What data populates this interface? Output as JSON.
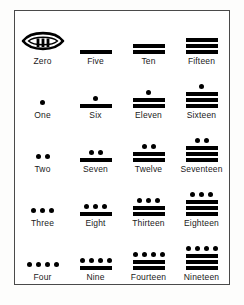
{
  "chart_data": {
    "type": "table",
    "columns": 4,
    "rows": 5,
    "notation": {
      "dot_value": 1,
      "bar_value": 5,
      "zero_symbol": "shell"
    },
    "cells": [
      {
        "value": 0,
        "label": "Zero",
        "symbol": "shell",
        "dots": 0,
        "bars": 0,
        "shell_strokes": 3
      },
      {
        "value": 5,
        "label": "Five",
        "symbol": "bars",
        "dots": 0,
        "bars": 1
      },
      {
        "value": 10,
        "label": "Ten",
        "symbol": "bars",
        "dots": 0,
        "bars": 2
      },
      {
        "value": 15,
        "label": "Fifteen",
        "symbol": "bars",
        "dots": 0,
        "bars": 3
      },
      {
        "value": 1,
        "label": "One",
        "symbol": "dots",
        "dots": 1,
        "bars": 0
      },
      {
        "value": 6,
        "label": "Six",
        "symbol": "mixed",
        "dots": 1,
        "bars": 1
      },
      {
        "value": 11,
        "label": "Eleven",
        "symbol": "mixed",
        "dots": 1,
        "bars": 2
      },
      {
        "value": 16,
        "label": "Sixteen",
        "symbol": "mixed",
        "dots": 1,
        "bars": 3
      },
      {
        "value": 2,
        "label": "Two",
        "symbol": "dots",
        "dots": 2,
        "bars": 0
      },
      {
        "value": 7,
        "label": "Seven",
        "symbol": "mixed",
        "dots": 2,
        "bars": 1
      },
      {
        "value": 12,
        "label": "Twelve",
        "symbol": "mixed",
        "dots": 2,
        "bars": 2
      },
      {
        "value": 17,
        "label": "Seventeen",
        "symbol": "mixed",
        "dots": 2,
        "bars": 3
      },
      {
        "value": 3,
        "label": "Three",
        "symbol": "dots",
        "dots": 3,
        "bars": 0
      },
      {
        "value": 8,
        "label": "Eight",
        "symbol": "mixed",
        "dots": 3,
        "bars": 1
      },
      {
        "value": 13,
        "label": "Thirteen",
        "symbol": "mixed",
        "dots": 3,
        "bars": 2
      },
      {
        "value": 18,
        "label": "Eighteen",
        "symbol": "mixed",
        "dots": 3,
        "bars": 3
      },
      {
        "value": 4,
        "label": "Four",
        "symbol": "dots",
        "dots": 4,
        "bars": 0
      },
      {
        "value": 9,
        "label": "Nine",
        "symbol": "mixed",
        "dots": 4,
        "bars": 1
      },
      {
        "value": 14,
        "label": "Fourteen",
        "symbol": "mixed",
        "dots": 4,
        "bars": 2
      },
      {
        "value": 19,
        "label": "Nineteen",
        "symbol": "mixed",
        "dots": 4,
        "bars": 3
      }
    ]
  },
  "colors": {
    "ink": "#000000",
    "border": "#4a4a4a",
    "paper": "#ffffff",
    "page": "#fdfdfc",
    "label_text": "#1a1a1a"
  }
}
